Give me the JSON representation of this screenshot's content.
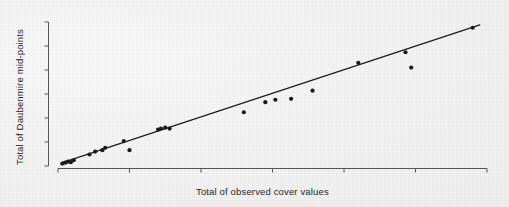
{
  "figure": {
    "background_color": "#f1f1f1",
    "ink_color": "#262626"
  },
  "chart_data": {
    "type": "scatter",
    "title": "",
    "xlabel": "Total of observed cover values",
    "ylabel": "Total of Daubenmire mid-points",
    "xlim": [
      0,
      300
    ],
    "ylim": [
      0,
      300
    ],
    "xticks": [
      0,
      50,
      100,
      150,
      200,
      250,
      300
    ],
    "yticks": [
      0,
      50,
      100,
      150,
      200,
      250,
      300
    ],
    "xtick_labels": [
      "0",
      "50",
      "100",
      "150",
      "200",
      "250",
      "300"
    ],
    "ytick_labels": [
      "0",
      "50",
      "100",
      "150",
      "200",
      "250",
      "300"
    ],
    "grid": false,
    "legend": null,
    "marker": "filled-circle",
    "marker_color": "#1a1a1a",
    "points": [
      {
        "x": 3,
        "y": 5
      },
      {
        "x": 5,
        "y": 7
      },
      {
        "x": 7,
        "y": 9
      },
      {
        "x": 9,
        "y": 8
      },
      {
        "x": 11,
        "y": 12
      },
      {
        "x": 22,
        "y": 24
      },
      {
        "x": 26,
        "y": 30
      },
      {
        "x": 31,
        "y": 33
      },
      {
        "x": 33,
        "y": 38
      },
      {
        "x": 46,
        "y": 52
      },
      {
        "x": 50,
        "y": 33
      },
      {
        "x": 70,
        "y": 76
      },
      {
        "x": 72,
        "y": 78
      },
      {
        "x": 75,
        "y": 80
      },
      {
        "x": 78,
        "y": 78
      },
      {
        "x": 130,
        "y": 112
      },
      {
        "x": 145,
        "y": 133
      },
      {
        "x": 152,
        "y": 138
      },
      {
        "x": 163,
        "y": 140
      },
      {
        "x": 178,
        "y": 157
      },
      {
        "x": 210,
        "y": 215
      },
      {
        "x": 243,
        "y": 237
      },
      {
        "x": 247,
        "y": 205
      },
      {
        "x": 290,
        "y": 288
      }
    ],
    "trend_line": {
      "type": "linear-regression",
      "x_start": 3,
      "y_start": 7,
      "x_end": 295,
      "y_end": 294,
      "color": "#1a1a1a"
    }
  }
}
